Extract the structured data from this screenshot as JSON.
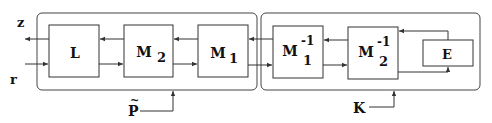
{
  "diagram": {
    "groups": [
      {
        "id": "P_tilde",
        "label": "P",
        "label_accent": "~"
      },
      {
        "id": "K",
        "label": "K"
      }
    ],
    "blocks": [
      {
        "id": "L",
        "label": "L",
        "sub": "",
        "sup": ""
      },
      {
        "id": "M2",
        "label": "M",
        "sub": "2",
        "sup": ""
      },
      {
        "id": "M1",
        "label": "M",
        "sub": "1",
        "sup": ""
      },
      {
        "id": "M1inv",
        "label": "M",
        "sub": "1",
        "sup": "-1"
      },
      {
        "id": "M2inv",
        "label": "M",
        "sub": "2",
        "sup": "-1"
      },
      {
        "id": "E",
        "label": "E",
        "sub": "",
        "sup": ""
      }
    ],
    "signals": {
      "output": "z",
      "input": "r"
    },
    "colors": {
      "stroke": "#333333",
      "text": "#111111",
      "background": "#ffffff"
    }
  }
}
